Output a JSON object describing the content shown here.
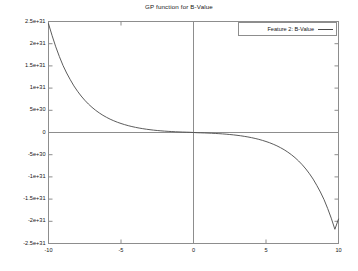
{
  "chart_data": {
    "type": "line",
    "title": "GP function for B-Value",
    "xlabel": "",
    "ylabel": "",
    "xlim": [
      -10,
      10
    ],
    "ylim": [
      -2.5e+31,
      2.5e+31
    ],
    "grid": false,
    "legend_position": "top-right",
    "zero_lines": {
      "horizontal_y": 0,
      "vertical_x": 0
    },
    "xticks": [
      -10,
      -5,
      0,
      5,
      10
    ],
    "xtick_labels": [
      "-10",
      "-5",
      "0",
      "5",
      "10"
    ],
    "yticks": [
      2.5e+31,
      2e+31,
      1.5e+31,
      1e+31,
      5e+30,
      0,
      -5e+30,
      -1e+31,
      -1.5e+31,
      -2e+31,
      -2.5e+31
    ],
    "ytick_labels": [
      "2.5e+31",
      "2e+31",
      "1.5e+31",
      "1e+31",
      "5e+30",
      "0",
      "-5e+30",
      "-1e+31",
      "-1.5e+31",
      "-2e+31",
      "-2.5e+31"
    ],
    "series": [
      {
        "name": "Feature 2: B-Value",
        "color": "#4a4a4a",
        "x": [
          -10.0,
          -9.75,
          -9.5,
          -9.25,
          -9.0,
          -8.75,
          -8.5,
          -8.25,
          -8.0,
          -7.75,
          -7.5,
          -7.25,
          -7.0,
          -6.75,
          -6.5,
          -6.25,
          -6.0,
          -5.75,
          -5.5,
          -5.25,
          -5.0,
          -4.75,
          -4.5,
          -4.25,
          -4.0,
          -3.75,
          -3.5,
          -3.25,
          -3.0,
          -2.75,
          -2.5,
          -2.25,
          -2.0,
          -1.75,
          -1.5,
          -1.25,
          -1.0,
          -0.75,
          -0.5,
          -0.25,
          0.0,
          0.25,
          0.5,
          0.75,
          1.0,
          1.25,
          1.5,
          1.75,
          2.0,
          2.25,
          2.5,
          2.75,
          3.0,
          3.25,
          3.5,
          3.75,
          4.0,
          4.25,
          4.5,
          4.75,
          5.0,
          5.25,
          5.5,
          5.75,
          6.0,
          6.25,
          6.5,
          6.75,
          7.0,
          7.25,
          7.5,
          7.75,
          8.0,
          8.25,
          8.5,
          8.75,
          9.0,
          9.25,
          9.5,
          9.75,
          10.0
        ],
        "y": [
          2.45e+31,
          2.18e+31,
          1.93e+31,
          1.71e+31,
          1.51e+31,
          1.34e+31,
          1.19e+31,
          1.05e+31,
          9.3e+30,
          8.22e+30,
          7.27e+30,
          6.42e+30,
          5.67e+30,
          5e+30,
          4.41e+30,
          3.88e+30,
          3.42e+30,
          3e+30,
          2.64e+30,
          2.31e+30,
          2.03e+30,
          1.77e+30,
          1.54e+30,
          1.34e+30,
          1.16e+30,
          1e+30,
          8.62e+29,
          7.38e+29,
          6.3e+29,
          5.34e+29,
          4.51e+29,
          3.78e+29,
          3.14e+29,
          2.59e+29,
          2.11e+29,
          1.69e+29,
          1.33e+29,
          1.02e+29,
          7.5e+28,
          5.2e+28,
          0.0,
          -5.2e+28,
          -7.5e+28,
          -1.02e+29,
          -1.33e+29,
          -1.69e+29,
          -2.11e+29,
          -2.59e+29,
          -3.14e+29,
          -3.78e+29,
          -4.51e+29,
          -5.34e+29,
          -6.3e+29,
          -7.38e+29,
          -8.62e+29,
          -1e+30,
          -1.16e+30,
          -1.34e+30,
          -1.54e+30,
          -1.77e+30,
          -2.03e+30,
          -2.31e+30,
          -2.64e+30,
          -3e+30,
          -3.42e+30,
          -3.88e+30,
          -4.41e+30,
          -5e+30,
          -5.67e+30,
          -6.42e+30,
          -7.27e+30,
          -8.22e+30,
          -9.3e+30,
          -1.05e+31,
          -1.19e+31,
          -1.34e+31,
          -1.51e+31,
          -1.71e+31,
          -1.93e+31,
          -2.18e+31,
          -1.95e+31
        ]
      }
    ],
    "axes_color": "#8d8d8d",
    "background_color": "#ffffff"
  },
  "legend": {
    "entries": [
      {
        "label": "Feature 2: B-Value"
      }
    ]
  }
}
